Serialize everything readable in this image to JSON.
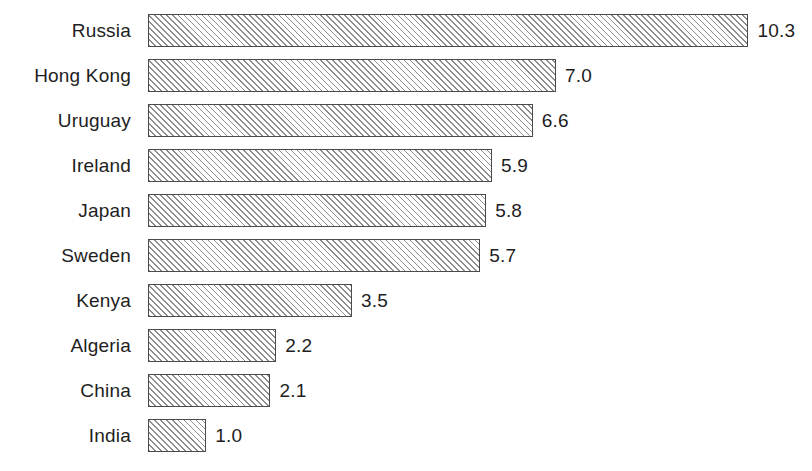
{
  "chart_data": {
    "type": "bar",
    "orientation": "horizontal",
    "title": "",
    "subtitle": "",
    "xlabel": "",
    "ylabel": "",
    "xlim": [
      0,
      10.3
    ],
    "grid": false,
    "legend": null,
    "value_labels_shown": true,
    "categories": [
      "Russia",
      "Hong Kong",
      "Uruguay",
      "Ireland",
      "Japan",
      "Sweden",
      "Kenya",
      "Algeria",
      "China",
      "India"
    ],
    "values": [
      10.3,
      7.0,
      6.6,
      5.9,
      5.8,
      5.7,
      3.5,
      2.2,
      2.1,
      1.0
    ],
    "value_labels": [
      "10.3",
      "7.0",
      "6.6",
      "5.9",
      "5.8",
      "5.7",
      "3.5",
      "2.2",
      "2.1",
      "1.0"
    ],
    "bars": [
      {
        "category": "Russia",
        "value": 10.3,
        "label": "10.3"
      },
      {
        "category": "Hong Kong",
        "value": 7.0,
        "label": "7.0"
      },
      {
        "category": "Uruguay",
        "value": 6.6,
        "label": "6.6"
      },
      {
        "category": "Ireland",
        "value": 5.9,
        "label": "5.9"
      },
      {
        "category": "Japan",
        "value": 5.8,
        "label": "5.8"
      },
      {
        "category": "Sweden",
        "value": 5.7,
        "label": "5.7"
      },
      {
        "category": "Kenya",
        "value": 3.5,
        "label": "3.5"
      },
      {
        "category": "Algeria",
        "value": 2.2,
        "label": "2.2"
      },
      {
        "category": "China",
        "value": 2.1,
        "label": "2.1"
      },
      {
        "category": "India",
        "value": 1.0,
        "label": "1.0"
      }
    ]
  },
  "style": {
    "bar_fill": "#f2f2f2",
    "bar_hatch": "#8c8c8c",
    "bar_border": "#4a4a4a",
    "text_color": "#1e1e1e",
    "background": "#ffffff"
  },
  "geometry": {
    "bar_origin_x": 148,
    "px_per_unit": 58.3,
    "bar_height": 33,
    "row_pitch": 45,
    "first_row_top": 14,
    "label_right_edge": 131,
    "value_gap": 9
  }
}
